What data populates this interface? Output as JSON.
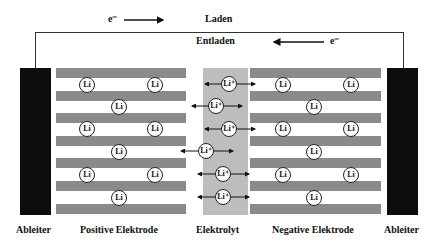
{
  "diagram": {
    "title_charge": "Laden",
    "title_discharge": "Entladen",
    "electron_label_charge": "e⁻",
    "electron_label_discharge": "e⁻",
    "ion_label": "Li",
    "ion_label_charged": "Li⁺",
    "colors": {
      "collector": "#0d0d0d",
      "electrode_stripe": "#8a8a8a",
      "electrolyte": "#bdbdbd",
      "wire": "#333333"
    },
    "labels": {
      "left_collector": "Ableiter",
      "positive_electrode": "Positive Elektrode",
      "electrolyte": "Elektrolyt",
      "negative_electrode": "Negative Elektrode",
      "right_collector": "Ableiter"
    },
    "electrode_layers": 7,
    "positive_ions": 10,
    "negative_ions": 10,
    "electrolyte_ions": 6
  }
}
